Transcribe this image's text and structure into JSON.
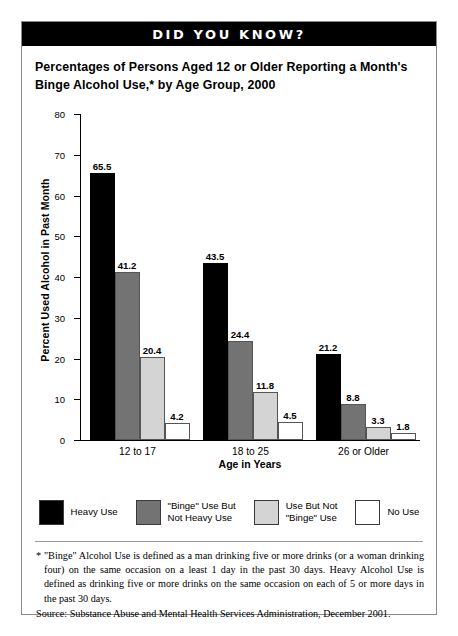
{
  "banner": {
    "text": "DID YOU KNOW?"
  },
  "chart_data": {
    "type": "bar",
    "title": "Percentages of Persons Aged 12 or Older Reporting a Month's Binge Alcohol Use,* by Age Group, 2000",
    "xlabel": "Age in Years",
    "ylabel": "Percent Used Alcohol in Past Month",
    "ylim": [
      0,
      80
    ],
    "yticks": [
      0,
      10,
      20,
      30,
      40,
      50,
      60,
      70,
      80
    ],
    "grid": false,
    "legend_position": "bottom",
    "categories": [
      "12 to 17",
      "18 to 25",
      "26 or Older"
    ],
    "series": [
      {
        "name": "Heavy Use",
        "color": "#000000",
        "values": [
          65.5,
          43.5,
          21.2
        ]
      },
      {
        "name": "\"Binge\" Use But\nNot Heavy Use",
        "color": "#737373",
        "values": [
          41.2,
          24.4,
          8.8
        ]
      },
      {
        "name": "Use But Not\n\"Binge\" Use",
        "color": "#d4d4d4",
        "values": [
          20.4,
          11.8,
          3.3
        ]
      },
      {
        "name": "No Use",
        "color": "#ffffff",
        "values": [
          4.2,
          4.5,
          1.8
        ]
      }
    ]
  },
  "footnote": "* \"Binge\" Alcohol Use is defined as a man drinking five or more drinks (or a woman drinking four) on the same occasion on a least 1 day in the past 30 days. Heavy Alcohol Use is defined as drinking five or more drinks on the  same occasion on each of 5 or more days in the past 30 days.",
  "source": "Source:  Substance Abuse and Mental Health Services Administration, December 2001."
}
